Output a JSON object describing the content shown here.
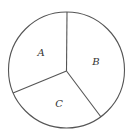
{
  "diagram": {
    "type": "circle-sectors",
    "stroke_color": "#555555",
    "label_color": "#333333",
    "circle": {
      "cx": 66.5,
      "cy": 70,
      "r": 58
    },
    "center": {
      "x": 66.5,
      "y": 71
    },
    "radii_endpoints": [
      {
        "name": "top",
        "x": 67,
        "y": 12
      },
      {
        "name": "lower-left",
        "x": 13,
        "y": 93
      },
      {
        "name": "lower-right",
        "x": 101,
        "y": 117
      }
    ],
    "sectors": [
      {
        "label": "A",
        "x": 41,
        "y": 53
      },
      {
        "label": "B",
        "x": 96,
        "y": 62
      },
      {
        "label": "C",
        "x": 59,
        "y": 104
      }
    ]
  }
}
